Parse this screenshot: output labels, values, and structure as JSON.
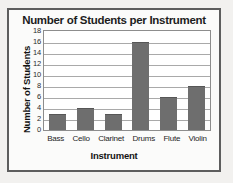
{
  "chart_data": {
    "type": "bar",
    "title": "Number of Students per Instrument",
    "xlabel": "Instrument",
    "ylabel": "Number of Students",
    "categories": [
      "Bass",
      "Cello",
      "Clarinet",
      "Drums",
      "Flute",
      "Violin"
    ],
    "values": [
      3,
      4,
      3,
      16,
      6,
      8
    ],
    "ylim": [
      0,
      18
    ],
    "ytick_step": 2,
    "yticks": [
      18,
      16,
      14,
      12,
      10,
      8,
      6,
      4,
      2,
      0
    ],
    "grid": true,
    "legend": null,
    "colors": {
      "bar": "#6e6e6e",
      "plot_background": "#ffffff",
      "gridline": "#a9a9a9",
      "frame_border": "#5d5d5d",
      "page_background": "#f2f1ef",
      "text": "#1d1d1d"
    }
  }
}
